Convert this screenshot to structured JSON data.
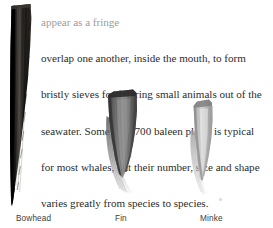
{
  "page": {
    "width": 273,
    "height": 228,
    "background": "#ffffff",
    "text_color": "#2c2c2c",
    "caption_color": "#3b3b3b"
  },
  "body_text": {
    "clipped_top_line": "appear as a fringe",
    "lines": [
      "overlap one another, inside the mouth, to form",
      "bristly sieves for filtering small animals out of the",
      "seawater. Some 400–700 baleen plates is typical",
      "for most whales, but their number, size and shape",
      "varies greatly from species to species."
    ],
    "full_paragraph": "overlap one another, inside the mouth, to form bristly sieves for filtering small animals out of the seawater. Some 400–700 baleen plates is typical for most whales, but their number, size and shape varies greatly from species to species."
  },
  "figure": {
    "specimens": [
      {
        "id": "bowhead",
        "caption": "Bowhead",
        "caption_x": 16,
        "caption_y": 214,
        "color_dark": "#0d0d0d",
        "color_mid": "#2a2724",
        "color_light": "#5a5550",
        "description": "long dark tapering baleen plate"
      },
      {
        "id": "fin",
        "caption": "Fin",
        "caption_x": 115,
        "caption_y": 214,
        "color_dark": "#3a3a3a",
        "color_mid": "#6e6e6e",
        "color_light": "#a8a8a8",
        "description": "short broad grey baleen plate with bristle fringe"
      },
      {
        "id": "minke",
        "caption": "Minke",
        "caption_x": 200,
        "caption_y": 214,
        "color_dark": "#8a8a8a",
        "color_mid": "#b0b0b0",
        "color_light": "#d4d4d4",
        "description": "small pale narrow baleen plate"
      }
    ]
  }
}
